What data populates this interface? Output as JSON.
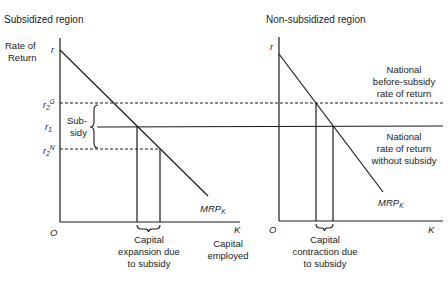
{
  "diagram": {
    "left_panel": {
      "title": "Subsidized region",
      "y_axis_label_line1": "Rate of",
      "y_axis_label_line2": "Return",
      "y_intercept_label": "r",
      "level_labels": {
        "r2G_base": "r",
        "r2G_sub": "2",
        "r2G_sup": "G",
        "r1_base": "r",
        "r1_sub": "1",
        "r2N_base": "r",
        "r2N_sub": "2",
        "r2N_sup": "N"
      },
      "subsidy_label_line1": "Sub-",
      "subsidy_label_line2": "sidy",
      "origin_label": "O",
      "x_axis_end_label": "K",
      "curve_label_base": "MRP",
      "curve_label_sub": "K",
      "brace_caption_line1": "Capital",
      "brace_caption_line2": "expansion due",
      "brace_caption_line3": "to subsidy",
      "x_axis_caption_line1": "Capital",
      "x_axis_caption_line2": "employed"
    },
    "right_panel": {
      "title": "Non-subsidized region",
      "y_intercept_label": "r",
      "origin_label": "O",
      "x_axis_end_label": "K",
      "curve_label_base": "MRP",
      "curve_label_sub": "K",
      "dashed_line_caption_line1": "National",
      "dashed_line_caption_line2": "before-subsidy",
      "dashed_line_caption_line3": "rate of return",
      "solid_line_caption_line1": "National",
      "solid_line_caption_line2": "rate of return",
      "solid_line_caption_line3": "without subsidy",
      "brace_caption_line1": "Capital",
      "brace_caption_line2": "contraction due",
      "brace_caption_line3": "to subsidy"
    }
  }
}
